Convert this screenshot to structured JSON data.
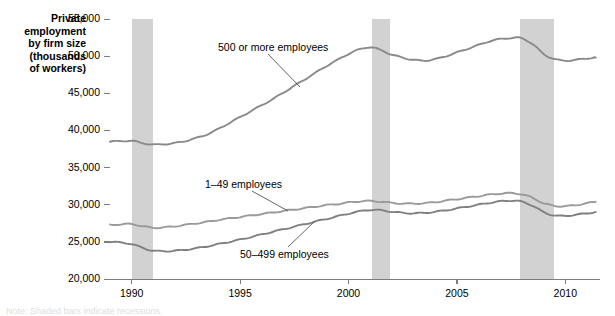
{
  "figure": {
    "y_axis_title_lines": [
      "Private",
      "employment",
      "by firm size",
      "(thousands",
      "of workers)"
    ],
    "caption_sliver": "Note: Shaded bars indicate recessions."
  },
  "colors": {
    "line_large": "#8a8a8a",
    "line_small": "#9a9a9a",
    "line_mid": "#808080",
    "recession_band": "#d2d2d2",
    "axis": "#7d7d7d",
    "text": "#000000"
  },
  "chart_data": {
    "type": "line",
    "title": "",
    "subtitle": "",
    "xlabel": "",
    "ylabel": "Private employment by firm size (thousands of workers)",
    "xlim": [
      1989.0,
      2011.6
    ],
    "ylim": [
      20000,
      55000
    ],
    "grid": false,
    "legend_position": "inline-annotations",
    "ytick_labels": [
      "20,000",
      "25,000",
      "30,000",
      "35,000",
      "40,000",
      "45,000",
      "50,000",
      "55,000"
    ],
    "ytick_values": [
      20000,
      25000,
      30000,
      35000,
      40000,
      45000,
      50000,
      55000
    ],
    "xtick_labels": [
      "1990",
      "1995",
      "2000",
      "2005",
      "2010"
    ],
    "xtick_values": [
      1990,
      1995,
      2000,
      2005,
      2010
    ],
    "shaded_regions": [
      {
        "label": "recession",
        "x0": 1990.0,
        "x1": 1991.0
      },
      {
        "label": "recession",
        "x0": 2001.1,
        "x1": 2001.9
      },
      {
        "label": "recession",
        "x0": 2007.9,
        "x1": 2009.5
      }
    ],
    "annotations": [
      {
        "text": "500 or more employees",
        "x": 1993.0,
        "y": 52300
      },
      {
        "text": "1–49 employees",
        "x": 1994.6,
        "y": 33500
      },
      {
        "text": "50–499 employees",
        "x": 1995.4,
        "y": 23500
      }
    ],
    "series": [
      {
        "name": "500 or more employees",
        "x": [
          1989.0,
          1989.5,
          1990.0,
          1990.5,
          1991.0,
          1991.5,
          1992.0,
          1992.5,
          1993.0,
          1993.5,
          1994.0,
          1994.5,
          1995.0,
          1995.5,
          1996.0,
          1996.5,
          1997.0,
          1997.5,
          1998.0,
          1998.5,
          1999.0,
          1999.5,
          2000.0,
          2000.5,
          2001.0,
          2001.5,
          2002.0,
          2002.5,
          2003.0,
          2003.5,
          2004.0,
          2004.5,
          2005.0,
          2005.5,
          2006.0,
          2006.5,
          2007.0,
          2007.5,
          2008.0,
          2008.5,
          2009.0,
          2009.5,
          2010.0,
          2010.5,
          2011.0,
          2011.4
        ],
        "values": [
          38500,
          38550,
          38600,
          38300,
          38100,
          38150,
          38300,
          38600,
          39000,
          39500,
          40200,
          41000,
          41800,
          42600,
          43400,
          44200,
          45100,
          46000,
          46900,
          47800,
          48700,
          49500,
          50300,
          50900,
          51200,
          50800,
          50200,
          49800,
          49500,
          49400,
          49600,
          50000,
          50500,
          51000,
          51500,
          52000,
          52300,
          52450,
          52400,
          51600,
          50300,
          49600,
          49400,
          49500,
          49700,
          49800
        ]
      },
      {
        "name": "1–49 employees",
        "x": [
          1989.0,
          1989.5,
          1990.0,
          1990.5,
          1991.0,
          1991.5,
          1992.0,
          1992.5,
          1993.0,
          1993.5,
          1994.0,
          1994.5,
          1995.0,
          1995.5,
          1996.0,
          1996.5,
          1997.0,
          1997.5,
          1998.0,
          1998.5,
          1999.0,
          1999.5,
          2000.0,
          2000.5,
          2001.0,
          2001.5,
          2002.0,
          2002.5,
          2003.0,
          2003.5,
          2004.0,
          2004.5,
          2005.0,
          2005.5,
          2006.0,
          2006.5,
          2007.0,
          2007.5,
          2008.0,
          2008.5,
          2009.0,
          2009.5,
          2010.0,
          2010.5,
          2011.0,
          2011.4
        ],
        "values": [
          27300,
          27350,
          27400,
          27100,
          26900,
          26950,
          27100,
          27300,
          27500,
          27700,
          27950,
          28150,
          28350,
          28550,
          28750,
          28950,
          29150,
          29350,
          29550,
          29750,
          29950,
          30100,
          30300,
          30450,
          30500,
          30400,
          30250,
          30150,
          30150,
          30200,
          30350,
          30550,
          30750,
          30950,
          31150,
          31350,
          31500,
          31550,
          31400,
          30900,
          30200,
          29850,
          29800,
          29950,
          30200,
          30400
        ]
      },
      {
        "name": "50–499 employees",
        "x": [
          1989.0,
          1989.5,
          1990.0,
          1990.5,
          1991.0,
          1991.5,
          1992.0,
          1992.5,
          1993.0,
          1993.5,
          1994.0,
          1994.5,
          1995.0,
          1995.5,
          1996.0,
          1996.5,
          1997.0,
          1997.5,
          1998.0,
          1998.5,
          1999.0,
          1999.5,
          2000.0,
          2000.5,
          2001.0,
          2001.5,
          2002.0,
          2002.5,
          2003.0,
          2003.5,
          2004.0,
          2004.5,
          2005.0,
          2005.5,
          2006.0,
          2006.5,
          2007.0,
          2007.5,
          2008.0,
          2008.5,
          2009.0,
          2009.5,
          2010.0,
          2010.5,
          2011.0,
          2011.4
        ],
        "values": [
          25000,
          24900,
          24700,
          24200,
          23800,
          23750,
          23800,
          23950,
          24150,
          24400,
          24700,
          25000,
          25300,
          25650,
          26000,
          26350,
          26700,
          27050,
          27400,
          27750,
          28100,
          28450,
          28800,
          29100,
          29300,
          29250,
          29050,
          28900,
          28850,
          28900,
          29050,
          29250,
          29500,
          29750,
          30000,
          30250,
          30450,
          30550,
          30400,
          29850,
          29000,
          28550,
          28500,
          28650,
          28850,
          29000
        ]
      }
    ]
  }
}
